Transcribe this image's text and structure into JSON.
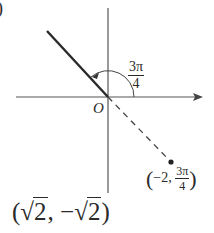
{
  "diagram": {
    "type": "polar-coordinate-plot",
    "corner_mark": ")",
    "origin_label": "O",
    "angle_label": {
      "numerator": "3π",
      "denominator": "4"
    },
    "point_label": {
      "r": "−2",
      "theta_numerator": "3π",
      "theta_denominator": "4"
    },
    "rectangular_answer": {
      "x": "2",
      "y": "2",
      "x_prefix": "√",
      "y_prefix": "−√"
    },
    "colors": {
      "axis": "#555555",
      "ray": "#2a2a2a",
      "text": "#2a2a2a"
    }
  }
}
